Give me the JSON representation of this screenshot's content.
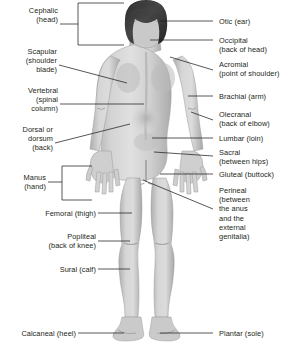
{
  "diagram": {
    "view": "posterior",
    "background_color": "#ffffff",
    "text_color": "#231f20",
    "leader_color": "#231f20",
    "figure_colors": {
      "skin_light": "#dedede",
      "skin_mid": "#c9c9c9",
      "skin_shadow": "#a9a9a9",
      "outline": "#9b9b9b",
      "hair": "#3a3a3a"
    }
  },
  "labels_left": [
    {
      "id": "cephalic",
      "term": "Cephalic",
      "detail": "(head)",
      "text": "Cephalic\n(head)",
      "leader": "bracket"
    },
    {
      "id": "scapular",
      "term": "Scapular",
      "detail": "(shoulder blade)",
      "text": "Scapular\n(shoulder\nblade)",
      "leader": "line"
    },
    {
      "id": "vertebral",
      "term": "Vertebral",
      "detail": "(spinal column)",
      "text": "Vertebral\n(spinal\ncolumn)",
      "leader": "line"
    },
    {
      "id": "dorsal",
      "term": "Dorsal or dorsum",
      "detail": "(back)",
      "text": "Dorsal or\ndorsum\n(back)",
      "leader": "line"
    },
    {
      "id": "manus",
      "term": "Manus",
      "detail": "(hand)",
      "text": "Manus\n(hand)",
      "leader": "bracket"
    },
    {
      "id": "femoral",
      "term": "Femoral",
      "detail": "(thigh)",
      "text": "Femoral (thigh)",
      "leader": "line"
    },
    {
      "id": "popliteal",
      "term": "Popliteal",
      "detail": "(back of knee)",
      "text": "Popliteal\n(back of knee)",
      "leader": "line"
    },
    {
      "id": "sural",
      "term": "Sural",
      "detail": "(calf)",
      "text": "Sural (calf)",
      "leader": "line"
    },
    {
      "id": "calcaneal",
      "term": "Calcaneal",
      "detail": "(heel)",
      "text": "Calcaneal (heel)",
      "leader": "line"
    }
  ],
  "labels_right": [
    {
      "id": "otic",
      "term": "Otic",
      "detail": "(ear)",
      "text": "Otic (ear)",
      "leader": "line"
    },
    {
      "id": "occipital",
      "term": "Occipital",
      "detail": "(back of head)",
      "text": "Occipital\n(back of head)",
      "leader": "line"
    },
    {
      "id": "acromial",
      "term": "Acromial",
      "detail": "(point of shoulder)",
      "text": "Acromial\n(point of shoulder)",
      "leader": "line"
    },
    {
      "id": "brachial",
      "term": "Brachial",
      "detail": "(arm)",
      "text": "Brachial (arm)",
      "leader": "line"
    },
    {
      "id": "olecranal",
      "term": "Olecranal",
      "detail": "(back of elbow)",
      "text": "Olecranal\n(back of elbow)",
      "leader": "line"
    },
    {
      "id": "lumbar",
      "term": "Lumbar",
      "detail": "(loin)",
      "text": "Lumbar (loin)",
      "leader": "line"
    },
    {
      "id": "sacral",
      "term": "Sacral",
      "detail": "(between hips)",
      "text": "Sacral\n(between hips)",
      "leader": "line"
    },
    {
      "id": "gluteal",
      "term": "Gluteal",
      "detail": "(buttock)",
      "text": "Gluteal (buttock)",
      "leader": "line"
    },
    {
      "id": "perineal",
      "term": "Perineal",
      "detail": "(between the anus and the external genitalia)",
      "text": "Perineal\n(between\nthe anus\nand the\nexternal\ngenitalia)",
      "leader": "line"
    },
    {
      "id": "plantar",
      "term": "Plantar",
      "detail": "(sole)",
      "text": "Plantar (sole)",
      "leader": "line"
    }
  ]
}
